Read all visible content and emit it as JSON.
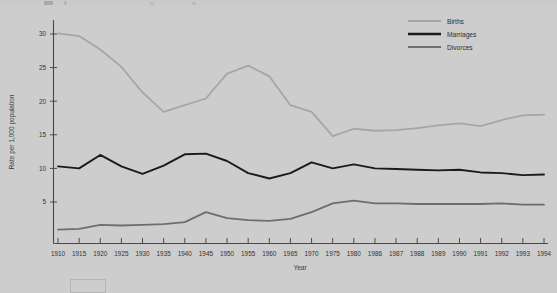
{
  "chart_data": {
    "type": "line",
    "title": "",
    "xlabel": "Year",
    "ylabel": "Rate per 1,000 population",
    "categories": [
      "1910",
      "1915",
      "1920",
      "1925",
      "1930",
      "1935",
      "1940",
      "1945",
      "1950",
      "1955",
      "1960",
      "1965",
      "1970",
      "1975",
      "1980",
      "1986",
      "1987",
      "1988",
      "1989",
      "1990",
      "1991",
      "1992",
      "1993",
      "1994"
    ],
    "xtick_labels": [
      "1910",
      "1915",
      "1920",
      "1925",
      "1930",
      "1935",
      "1940",
      "1945",
      "1950",
      "1955",
      "1960",
      "1965",
      "1970",
      "1975",
      "1980",
      "1986",
      "1987",
      "1988",
      "1989",
      "1990",
      "1991",
      "1992",
      "1993",
      "1994"
    ],
    "ytick_labels": [
      "5",
      "10",
      "15",
      "20",
      "25",
      "30"
    ],
    "ytick_values": [
      5,
      10,
      15,
      20,
      25,
      30
    ],
    "ylim": [
      0,
      32
    ],
    "grid": false,
    "legend_position": "top-right",
    "series": [
      {
        "name": "Births",
        "color": "#a6a6a6",
        "values": [
          30.1,
          29.7,
          27.7,
          25.1,
          21.3,
          18.4,
          19.4,
          20.4,
          24.1,
          25.3,
          23.7,
          19.4,
          18.4,
          14.8,
          15.9,
          15.6,
          15.7,
          16.0,
          16.4,
          16.7,
          16.3,
          17.2,
          17.9,
          18.0
        ]
      },
      {
        "name": "Marriages",
        "color": "#1a1a1a",
        "values": [
          10.3,
          10.0,
          12.0,
          10.3,
          9.2,
          10.4,
          12.1,
          12.2,
          11.1,
          9.3,
          8.5,
          9.3,
          10.9,
          10.0,
          10.6,
          10.0,
          9.9,
          9.8,
          9.7,
          9.8,
          9.4,
          9.3,
          9.0,
          9.1
        ]
      },
      {
        "name": "Divorces",
        "color": "#6e6e6e",
        "values": [
          0.9,
          1.0,
          1.6,
          1.5,
          1.6,
          1.7,
          2.0,
          3.5,
          2.6,
          2.3,
          2.2,
          2.5,
          3.5,
          4.8,
          5.2,
          4.8,
          4.8,
          4.7,
          4.7,
          4.7,
          4.7,
          4.8,
          4.6,
          4.6
        ]
      }
    ]
  },
  "legend": {
    "items": [
      {
        "label": "Births",
        "color": "#a6a6a6"
      },
      {
        "label": "Marriages",
        "color": "#1a1a1a"
      },
      {
        "label": "Divorces",
        "color": "#6e6e6e"
      }
    ]
  },
  "axes": {
    "y_title": "Rate per 1,000 population",
    "x_title": "Year"
  },
  "colors": {
    "background": "#cdcdcd",
    "axis": "#4a4a4a",
    "births": "#a6a6a6",
    "marriages": "#1a1a1a",
    "divorces": "#6e6e6e"
  }
}
